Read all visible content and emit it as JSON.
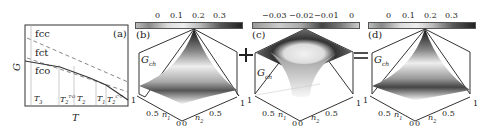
{
  "figure": {
    "panel_a": {
      "label": "(a)",
      "ylabel": "G",
      "xlabel": "T",
      "curves": [
        "fcc",
        "fct",
        "fco"
      ],
      "t_labels": [
        "T3",
        "T2",
        "T1"
      ],
      "t_label_texts": {
        "t3": "T",
        "t3_sub": "3",
        "t2fo": "T",
        "t2fo_sub": "2",
        "t2fo_sup": "T-O",
        "t2": "T",
        "t2_sub": "2",
        "t1": "T",
        "t1_sub": "1",
        "t2ct": "T",
        "t2ct_sub": "2",
        "t2ct_sup": "C-T"
      }
    },
    "panel_b": {
      "label": "(b)",
      "zlabel": "G",
      "zlabel_sub": "ch",
      "colorbar_ticks": [
        "0",
        "0.1",
        "0.2",
        "0.3"
      ],
      "axis_n1": "n",
      "axis_n1_sub": "1",
      "axis_n2": "n",
      "axis_n2_sub": "2",
      "ticks": {
        "left1": "1",
        "mid1": "0.5",
        "zero1": "0",
        "zero2": "0",
        "mid2": "0.5",
        "right1": "1"
      }
    },
    "panel_c": {
      "label": "(c)",
      "zlabel": "G",
      "zlabel_sub": "ch",
      "colorbar_ticks": [
        "−0.03",
        "−0.02",
        "−0.01",
        "0"
      ],
      "axis_n1": "n",
      "axis_n1_sub": "1",
      "axis_n2": "n",
      "axis_n2_sub": "2",
      "ticks": {
        "left1": "1",
        "mid1": "0.5",
        "zero1": "0",
        "zero2": "0",
        "mid2": "0.5",
        "right1": "1"
      }
    },
    "panel_d": {
      "label": "(d)",
      "zlabel": "G",
      "zlabel_sub": "ch",
      "colorbar_ticks": [
        "0",
        "0.1",
        "0.2",
        "0.3"
      ],
      "axis_n1": "n",
      "axis_n1_sub": "1",
      "axis_n2": "n",
      "axis_n2_sub": "2",
      "ticks": {
        "left1": "1",
        "mid1": "0.5",
        "zero1": "0",
        "zero2": "0",
        "mid2": "0.5",
        "right1": "1"
      }
    },
    "operators": {
      "plus": "+",
      "equals": "="
    }
  }
}
